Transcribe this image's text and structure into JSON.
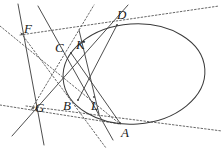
{
  "figure": {
    "canvas": {
      "width": 223,
      "height": 149,
      "background": "#ffffff"
    },
    "stroke": {
      "solid_color": "#3a3a3a",
      "dashed_color": "#555555",
      "conic_color": "#3a3a3a",
      "solid_width": 0.9,
      "dashed_width": 0.9,
      "conic_width": 1.0,
      "dash_pattern": "1.6 2.0"
    },
    "conic": {
      "type": "ellipse",
      "center_x": 134,
      "center_y": 74,
      "radius_x": 71,
      "radius_y": 50,
      "rotation_deg": -4
    },
    "points": [
      {
        "id": "A",
        "label": "A",
        "x": 120,
        "y": 123,
        "label_x": 121,
        "label_y": 126,
        "on_conic": true
      },
      {
        "id": "B",
        "label": "B",
        "x": 78,
        "y": 100,
        "label_x": 63,
        "label_y": 99,
        "on_conic": true
      },
      {
        "id": "C",
        "label": "C",
        "x": 71,
        "y": 53,
        "label_x": 55,
        "label_y": 41,
        "on_conic": true
      },
      {
        "id": "D",
        "label": "D",
        "x": 117,
        "y": 25,
        "label_x": 117,
        "label_y": 8,
        "on_conic": true
      },
      {
        "id": "F",
        "label": "F",
        "x": 22,
        "y": 34,
        "label_x": 24,
        "label_y": 22,
        "on_conic": false
      },
      {
        "id": "G",
        "label": "G",
        "x": 33,
        "y": 108,
        "label_x": 35,
        "label_y": 101,
        "on_conic": false
      },
      {
        "id": "K",
        "label": "K",
        "x": 84,
        "y": 42,
        "label_x": 76,
        "label_y": 38,
        "on_conic": false
      },
      {
        "id": "L",
        "label": "L",
        "x": 94,
        "y": 97,
        "label_x": 91,
        "label_y": 99,
        "on_conic": false
      },
      {
        "id": "X",
        "label": "",
        "x": 87,
        "y": 78,
        "label_x": 0,
        "label_y": 0,
        "on_conic": false
      }
    ],
    "segments": [
      {
        "id": "chord-AC",
        "from": [
          71,
          53
        ],
        "to": [
          120,
          123
        ],
        "style": "solid"
      },
      {
        "id": "chord-BD",
        "from": [
          78,
          100
        ],
        "to": [
          117,
          25
        ],
        "style": "solid"
      },
      {
        "id": "line-F-A",
        "from": [
          38,
          6
        ],
        "to": [
          113,
          140
        ],
        "style": "solid"
      },
      {
        "id": "line-F-G",
        "from": [
          18,
          4
        ],
        "to": [
          44,
          145
        ],
        "style": "solid"
      },
      {
        "id": "line-G-D",
        "from": [
          12,
          136
        ],
        "to": [
          128,
          5
        ],
        "style": "solid"
      },
      {
        "id": "line-KL",
        "from": [
          79,
          30
        ],
        "to": [
          99,
          114
        ],
        "style": "solid"
      },
      {
        "id": "polar-FG-dashed",
        "from": [
          0,
          26
        ],
        "to": [
          120,
          124
        ],
        "style": "dashed"
      },
      {
        "id": "tangent-at-D",
        "from": [
          20,
          35
        ],
        "to": [
          219,
          6
        ],
        "style": "dashed"
      },
      {
        "id": "tangent-at-A",
        "from": [
          26,
          106
        ],
        "to": [
          222,
          131
        ],
        "style": "dashed"
      },
      {
        "id": "line-G-leftdash",
        "from": [
          0,
          105
        ],
        "to": [
          120,
          124
        ],
        "style": "dashed"
      },
      {
        "id": "line-F-B-dashed",
        "from": [
          21,
          33
        ],
        "to": [
          106,
          148
        ],
        "style": "dashed"
      },
      {
        "id": "line-G-C-dashed",
        "from": [
          31,
          110
        ],
        "to": [
          94,
          5
        ],
        "style": "dashed"
      }
    ]
  }
}
